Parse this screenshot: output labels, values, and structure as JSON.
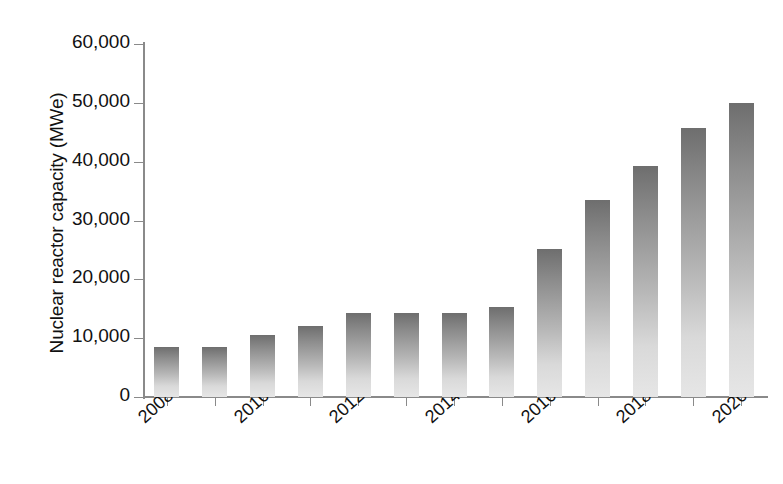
{
  "chart_data": {
    "type": "bar",
    "title": "",
    "subtitle": "",
    "xlabel": "",
    "ylabel": "Nuclear reactor capacity (MWe)",
    "categories": [
      "2008",
      "2009",
      "2010",
      "2011",
      "2012",
      "2013",
      "2014",
      "2015",
      "2016",
      "2017",
      "2018",
      "2019",
      "2020"
    ],
    "values": [
      8500,
      8500,
      10500,
      12000,
      14200,
      14200,
      14200,
      15300,
      25200,
      33500,
      39200,
      45800,
      49900
    ],
    "series": [
      {
        "name": "Nuclear reactor capacity",
        "values": [
          8500,
          8500,
          10500,
          12000,
          14200,
          14200,
          14200,
          15300,
          25200,
          33500,
          39200,
          45800,
          49900
        ]
      }
    ],
    "ylim": [
      0,
      60000
    ],
    "yticks": [
      0,
      10000,
      20000,
      30000,
      40000,
      50000,
      60000
    ],
    "ytick_labels": [
      "0",
      "10,000",
      "20,000",
      "30,000",
      "40,000",
      "50,000",
      "60,000"
    ],
    "xtick_labels_shown": [
      "2008",
      "2010",
      "2012",
      "2014",
      "2016",
      "2018",
      "2020"
    ],
    "xtick_label_rotation": -42,
    "grid": false,
    "legend": false,
    "legend_position": "none",
    "bar_color_top": "#6e6e6e",
    "bar_color_bottom": "#e6e6e6",
    "axis_color": "#8a8a8a",
    "background_color": "#ffffff"
  },
  "axes": {
    "y_title": "Nuclear reactor capacity (MWe)"
  }
}
